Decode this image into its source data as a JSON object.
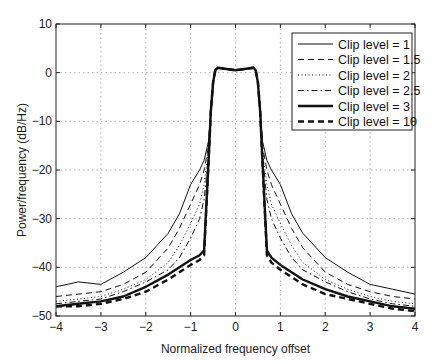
{
  "chart_data": {
    "type": "line",
    "title": "",
    "xlabel": "Normalized frequency offset",
    "ylabel": "Power/frequency (dB/Hz)",
    "xlim": [
      -4,
      4
    ],
    "ylim": [
      -50,
      10
    ],
    "xticks": [
      -4,
      -3,
      -2,
      -1,
      0,
      1,
      2,
      3,
      4
    ],
    "xtick_labels": [
      "−4",
      "−3",
      "−2",
      "−1",
      "0",
      "1",
      "2",
      "3",
      "4"
    ],
    "yticks": [
      10,
      0,
      -10,
      -20,
      -30,
      -40,
      -50
    ],
    "ytick_labels": [
      "10",
      "0",
      "−10",
      "−20",
      "−30",
      "−40",
      "−50"
    ],
    "grid": true,
    "legend_position": "upper right",
    "x": [
      -4,
      -3.5,
      -3,
      -2.5,
      -2,
      -1.5,
      -1.25,
      -1,
      -0.8,
      -0.7,
      -0.6,
      -0.55,
      -0.5,
      -0.45,
      -0.4,
      0,
      0.4,
      0.45,
      0.5,
      0.55,
      0.6,
      0.7,
      0.8,
      1,
      1.25,
      1.5,
      2,
      2.5,
      3,
      3.5,
      4
    ],
    "series": [
      {
        "name": "Clip level =   1",
        "style": "solid-thin",
        "values": [
          -44,
          -43,
          -43.5,
          -41,
          -38,
          -33,
          -29,
          -23,
          -20,
          -18,
          -14,
          -8,
          -2,
          0.5,
          1,
          0.5,
          1,
          0.5,
          -2,
          -8,
          -14,
          -18,
          -20,
          -23,
          -29,
          -33,
          -38,
          -41,
          -43.5,
          -44.5,
          -45.5
        ]
      },
      {
        "name": "Clip level = 1.5",
        "style": "dashed-thin",
        "values": [
          -46,
          -45.5,
          -45,
          -43.5,
          -41,
          -36,
          -32,
          -27,
          -23,
          -20,
          -15,
          -8,
          -2,
          0.5,
          1,
          0.5,
          1,
          0.5,
          -2,
          -8,
          -15,
          -20,
          -23,
          -27,
          -32,
          -36,
          -41,
          -43.5,
          -45,
          -46,
          -46.5
        ]
      },
      {
        "name": "Clip level =   2",
        "style": "dotted",
        "values": [
          -47,
          -46.5,
          -46,
          -44.5,
          -42.5,
          -39,
          -35.5,
          -31,
          -27,
          -23,
          -16,
          -8,
          -2,
          0.5,
          1,
          0.5,
          1,
          0.5,
          -2,
          -8,
          -16,
          -23,
          -27,
          -31,
          -35.5,
          -39,
          -42.5,
          -44.5,
          -46,
          -47,
          -47.5
        ]
      },
      {
        "name": "Clip level = 2.5",
        "style": "dashdot",
        "values": [
          -47.5,
          -47,
          -46.5,
          -45,
          -43,
          -40.5,
          -38,
          -34,
          -30,
          -26,
          -17,
          -8,
          -2,
          0.5,
          1,
          0.5,
          1,
          0.5,
          -2,
          -8,
          -17,
          -26,
          -30,
          -34,
          -38,
          -40.5,
          -43,
          -45,
          -46.5,
          -47.5,
          -48
        ]
      },
      {
        "name": "Clip level =   3",
        "style": "solid-thick",
        "values": [
          -48,
          -47.5,
          -47,
          -46,
          -44,
          -41.5,
          -40,
          -38.5,
          -37.5,
          -36.5,
          -18,
          -8,
          -2,
          0.5,
          1,
          0.5,
          1,
          0.5,
          -2,
          -8,
          -18,
          -36.5,
          -38,
          -39.5,
          -41,
          -42.5,
          -44.5,
          -46,
          -47,
          -48,
          -48.5
        ]
      },
      {
        "name": "Clip level =  10",
        "style": "dashed-thick",
        "values": [
          -48,
          -48,
          -47.5,
          -46.5,
          -45,
          -42.5,
          -41,
          -39.5,
          -38.5,
          -37.5,
          -18,
          -8,
          -2,
          0.5,
          1,
          0.5,
          1,
          0.5,
          -2,
          -8,
          -18,
          -37.5,
          -39,
          -40.5,
          -42,
          -43.5,
          -45.5,
          -46.5,
          -47.5,
          -48.5,
          -49
        ]
      }
    ]
  }
}
